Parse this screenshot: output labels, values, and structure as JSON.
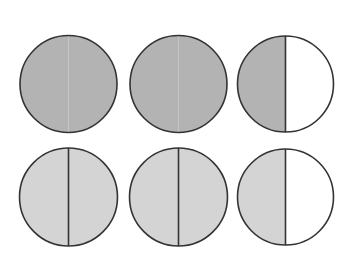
{
  "diagram": {
    "colors": {
      "dark_fill": "#b3b3b3",
      "light_fill": "#d4d4d4",
      "empty_fill": "#ffffff",
      "stroke": "#333333"
    },
    "rows": [
      {
        "name": "top-row",
        "circles": [
          {
            "cx": 68.5,
            "cy": 84,
            "r": 48.5,
            "split": false,
            "left_fill": "dark",
            "right_fill": "dark"
          },
          {
            "cx": 178.5,
            "cy": 84,
            "r": 48.5,
            "split": false,
            "left_fill": "dark",
            "right_fill": "dark"
          },
          {
            "cx": 285.5,
            "cy": 84,
            "r": 48,
            "split": true,
            "left_fill": "dark",
            "right_fill": "empty"
          }
        ]
      },
      {
        "name": "bottom-row",
        "circles": [
          {
            "cx": 68.5,
            "cy": 197,
            "r": 49,
            "split": true,
            "left_fill": "light",
            "right_fill": "light"
          },
          {
            "cx": 178.5,
            "cy": 197,
            "r": 49,
            "split": true,
            "left_fill": "light",
            "right_fill": "light"
          },
          {
            "cx": 285.5,
            "cy": 197,
            "r": 48,
            "split": true,
            "left_fill": "light",
            "right_fill": "empty"
          }
        ]
      }
    ]
  }
}
